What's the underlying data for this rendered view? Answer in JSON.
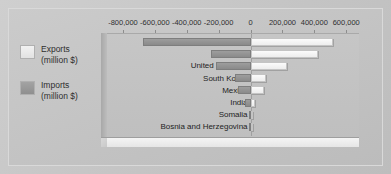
{
  "figure": {
    "background_color": "#c4c4c4",
    "frame_color": "#d9d9d9"
  },
  "legend": {
    "position": "left",
    "entries": [
      {
        "name": "exports",
        "label_line1": "Exports",
        "label_line2": "(million $)",
        "color": "#ededed"
      },
      {
        "name": "imports",
        "label_line1": "Imports",
        "label_line2": "(million $)",
        "color": "#9a9a9a"
      }
    ]
  },
  "chart_data": {
    "type": "bar",
    "orientation": "horizontal",
    "style": "tornado",
    "title": "",
    "xlabel": "",
    "ylabel": "",
    "xlim": [
      -900000,
      680000
    ],
    "grid": false,
    "legend_position": "left",
    "tick_labels": [
      "-800,000",
      "-600,000",
      "-400,000",
      "-200,000",
      "0",
      "200,000",
      "400,000",
      "600,000"
    ],
    "tick_values": [
      -800000,
      -600000,
      -400000,
      -200000,
      0,
      200000,
      400000,
      600000
    ],
    "categories": [
      "USA",
      "Japan",
      "United Kingdom",
      "South Korea",
      "Mexico",
      "India",
      "Somalia",
      "Bosnia and Herzegovina"
    ],
    "series": [
      {
        "name": "Imports (million $)",
        "direction": "negative",
        "values": [
          -675000,
          -250000,
          -215000,
          -95000,
          -80000,
          -35000,
          -2000,
          -3000
        ]
      },
      {
        "name": "Exports (million $)",
        "direction": "positive",
        "values": [
          515000,
          425000,
          230000,
          95000,
          85000,
          25000,
          1000,
          1500
        ]
      }
    ]
  }
}
